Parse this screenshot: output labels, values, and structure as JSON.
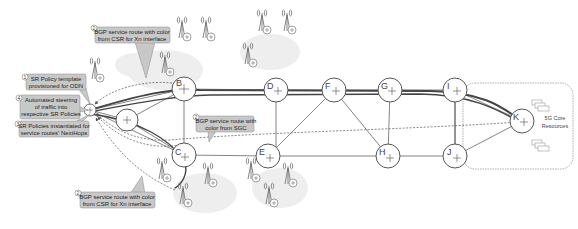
{
  "diagram": {
    "title": "",
    "colors": {
      "callout_fill": "#c8c8c8",
      "callout_stroke": "#888888",
      "cloud_fill": "#eeeeee",
      "line": "#555555",
      "route_line": "#444444",
      "node_stroke": "#555555",
      "core_box_stroke": "#999999"
    },
    "nodes": [
      {
        "id": "A",
        "label": "",
        "role": "csr"
      },
      {
        "id": "B",
        "label": "B",
        "role": "pre-agg"
      },
      {
        "id": "C",
        "label": "C",
        "role": "pre-agg"
      },
      {
        "id": "X",
        "label": "",
        "role": "pre-agg-mid"
      },
      {
        "id": "D",
        "label": "D",
        "role": "agg"
      },
      {
        "id": "E",
        "label": "E",
        "role": "agg"
      },
      {
        "id": "F",
        "label": "F",
        "role": "core"
      },
      {
        "id": "G",
        "label": "G",
        "role": "core"
      },
      {
        "id": "H",
        "label": "H",
        "role": "core"
      },
      {
        "id": "I",
        "label": "I",
        "role": "core"
      },
      {
        "id": "J",
        "label": "J",
        "role": "core"
      },
      {
        "id": "K",
        "label": "K",
        "role": "5g-core-pe"
      }
    ],
    "core": {
      "label_line1": "5G Core",
      "label_line2": "Resources"
    },
    "callouts": [
      {
        "num": "1",
        "line1": "SR Policy template",
        "line2": "provisioned for ODN",
        "line3": ""
      },
      {
        "num": "2",
        "line1": "BGP service route with color",
        "line2": "from CSR for Xn interface",
        "line3": ""
      },
      {
        "num": "2",
        "line1": "BGP service route with",
        "line2": "color from SGC",
        "line3": ""
      },
      {
        "num": "3",
        "line1": "SR Policies instantiated for",
        "line2": "service routes' NextHops",
        "line3": ""
      },
      {
        "num": "4",
        "line1": "Automated steering",
        "line2": "of traffic into",
        "line3": "respective SR Policies"
      },
      {
        "num": "2",
        "line1": "BGP service route with color",
        "line2": "from CSR for Xn interface",
        "line3": ""
      }
    ]
  }
}
